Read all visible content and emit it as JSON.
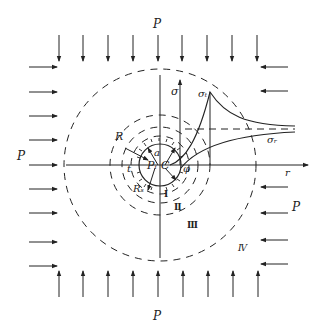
{
  "diagram": {
    "labels": {
      "p_top": "P",
      "p_bottom": "P",
      "p_left": "P",
      "p_right": "P",
      "sigma": "σ",
      "sigma_t": "σₜ",
      "sigma_r": "σᵣ",
      "r_axis": "r",
      "R": "R",
      "a": "a",
      "Pi": "Pᵢ",
      "C": "C",
      "t": "t",
      "phi": "φ",
      "Rs": "Rₛ",
      "zone1": "Ⅰ",
      "zone2": "Ⅱ",
      "zone3": "Ⅲ",
      "zone4": "Ⅳ"
    },
    "colors": {
      "line": "#222222",
      "background": "#ffffff"
    }
  }
}
